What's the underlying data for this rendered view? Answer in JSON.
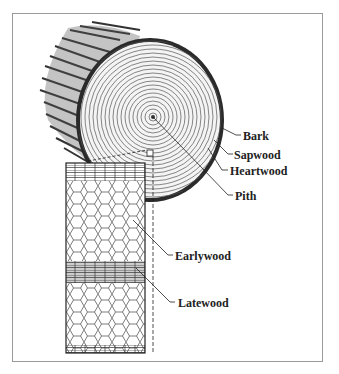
{
  "diagram": {
    "labels": {
      "bark": "Bark",
      "sapwood": "Sapwood",
      "heartwood": "Heartwood",
      "pith": "Pith",
      "earlywood": "Earlywood",
      "latewood": "Latewood"
    },
    "colors": {
      "ink": "#222222",
      "frame": "#9a9a9a",
      "background": "#ffffff"
    }
  }
}
